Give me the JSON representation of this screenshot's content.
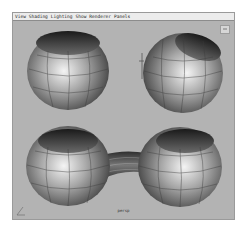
{
  "menubar": {
    "items": [
      "View",
      "Shading",
      "Lighting",
      "Show",
      "Renderer",
      "Panels"
    ]
  },
  "viewport": {
    "camera_label": "persp",
    "background_color": "#b3b3b3",
    "objects": [
      {
        "name": "sphere-top-left",
        "type": "open-sphere"
      },
      {
        "name": "sphere-top-right",
        "type": "open-sphere"
      },
      {
        "name": "sphere-bottom-left",
        "type": "open-sphere"
      },
      {
        "name": "sphere-bottom-right",
        "type": "open-sphere"
      },
      {
        "name": "bridge",
        "type": "connecting-tube"
      }
    ]
  }
}
